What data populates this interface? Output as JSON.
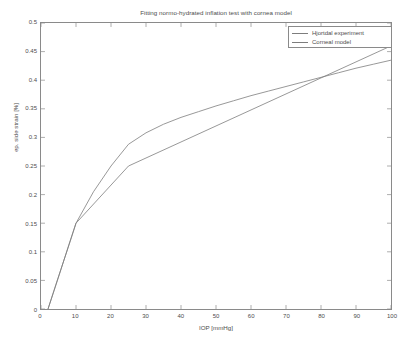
{
  "chart_data": {
    "type": "line",
    "title": "Fitting normo-hydrated inflation test with cornea model",
    "xlabel": "IOP [mmHg]",
    "ylabel": "ep. side strain [%]",
    "xlim": [
      0,
      100
    ],
    "ylim": [
      0,
      0.5
    ],
    "grid": false,
    "legend_position": "top-right",
    "xticks": [
      "0",
      "10",
      "20",
      "30",
      "40",
      "50",
      "60",
      "70",
      "80",
      "90",
      "100"
    ],
    "xtick_values": [
      0,
      10,
      20,
      30,
      40,
      50,
      60,
      70,
      80,
      90,
      100
    ],
    "yticks": [
      "0",
      "0.05",
      "0.1",
      "0.15",
      "0.2",
      "0.25",
      "0.3",
      "0.35",
      "0.4",
      "0.45",
      "0.5"
    ],
    "ytick_values": [
      0,
      0.05,
      0.1,
      0.15,
      0.2,
      0.25,
      0.3,
      0.35,
      0.4,
      0.45,
      0.5
    ],
    "line_color": "#7d7d7d",
    "axis_color": "#8a8a8a",
    "background_color": "#ffffff",
    "series": [
      {
        "name": "Hjortdal experiment",
        "color": "#7d7d7d",
        "x": [
          2,
          10,
          25,
          100
        ],
        "y": [
          0,
          0.15,
          0.25,
          0.46
        ]
      },
      {
        "name": "Corneal model",
        "color": "#7d7d7d",
        "x": [
          2,
          10,
          15,
          20,
          25,
          30,
          35,
          40,
          45,
          50,
          55,
          60,
          65,
          70,
          75,
          80,
          85,
          90,
          95,
          100
        ],
        "y": [
          0,
          0.15,
          0.205,
          0.25,
          0.288,
          0.308,
          0.323,
          0.335,
          0.345,
          0.355,
          0.364,
          0.373,
          0.381,
          0.389,
          0.397,
          0.405,
          0.413,
          0.421,
          0.428,
          0.435
        ]
      }
    ]
  },
  "legend": {
    "entries": [
      {
        "label": "Hjortdal experiment"
      },
      {
        "label": "Corneal model"
      }
    ]
  }
}
